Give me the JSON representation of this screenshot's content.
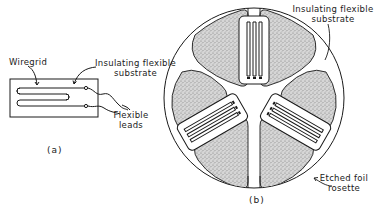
{
  "figure_a": {
    "caption": "(a)",
    "labels": {
      "wiregrid": "Wiregrid",
      "substrate_line1": "Insulating flexible",
      "substrate_line2": "substrate",
      "leads_line1": "Flexible",
      "leads_line2": "leads"
    }
  },
  "figure_b": {
    "caption": "(b)",
    "labels": {
      "substrate_line1": "Insulating flexible",
      "substrate_line2": "substrate",
      "rosette_line1": "Etched foil",
      "rosette_line2": "rosette"
    }
  },
  "colors": {
    "ink": "#1a1a1a",
    "stipple": "#bdbdbd",
    "background": "#ffffff"
  }
}
